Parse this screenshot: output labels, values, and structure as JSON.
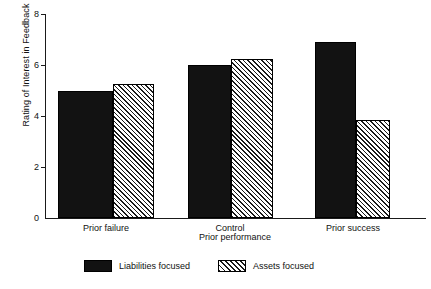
{
  "chart_data": {
    "type": "bar",
    "title": "",
    "xlabel": "Prior performance",
    "ylabel": "Rating of Interest in Feedback",
    "categories": [
      "Prior failure",
      "Control",
      "Prior success"
    ],
    "series": [
      {
        "name": "Liabilities focused",
        "values": [
          5.0,
          6.0,
          6.9
        ],
        "fill": "solid",
        "color": "#121212"
      },
      {
        "name": "Assets focused",
        "values": [
          5.25,
          6.25,
          3.85
        ],
        "fill": "hatched",
        "color": "#ffffff"
      }
    ],
    "ylim": [
      0,
      8
    ],
    "yticks": [
      0,
      2,
      4,
      6,
      8
    ],
    "ytick_labels": [
      "0",
      "2",
      "4",
      "6",
      "8"
    ],
    "grid": false,
    "legend_position": "bottom"
  },
  "axes": {
    "y_title": "Rating of Interest in Feedback",
    "x_title": "Prior performance",
    "y_ticks": [
      {
        "label": "8",
        "value": 8
      },
      {
        "label": "6",
        "value": 6
      },
      {
        "label": "4",
        "value": 4
      },
      {
        "label": "2",
        "value": 2
      },
      {
        "label": "0",
        "value": 0
      }
    ],
    "x_categories": [
      {
        "label": "Prior failure"
      },
      {
        "label": "Control"
      },
      {
        "label": "Prior success"
      }
    ]
  },
  "legend": {
    "items": [
      {
        "label": "Liabilities focused",
        "pattern": "solid"
      },
      {
        "label": "Assets focused",
        "pattern": "hatched"
      }
    ]
  }
}
